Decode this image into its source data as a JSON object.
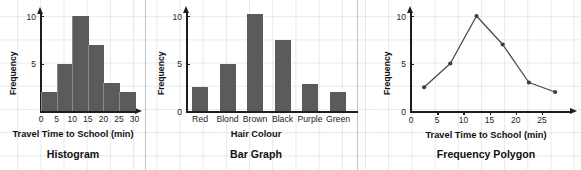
{
  "panels": [
    {
      "id": "histogram",
      "title": "Histogram",
      "xlabel": "Travel Time to School (min)",
      "ylabel": "Frequency",
      "xticks": [
        "0",
        "5",
        "10",
        "15",
        "20",
        "25",
        "30"
      ],
      "yticks": [
        "5",
        "10"
      ]
    },
    {
      "id": "bar-graph",
      "title": "Bar Graph",
      "xlabel": "Hair Colour",
      "ylabel": "Frequency",
      "yticks": [
        "0",
        "5",
        "10"
      ]
    },
    {
      "id": "frequency-polygon",
      "title": "Frequency Polygon",
      "xlabel": "Travel Time to School (min)",
      "ylabel": "Frequency",
      "xticks": [
        "0",
        "5",
        "10",
        "15",
        "20",
        "25"
      ],
      "yticks": [
        "0",
        "5",
        "10"
      ]
    }
  ],
  "colors": {
    "bar_fill": "#5b5b5b",
    "axis": "#1d1d1d",
    "grid": "#aab9cd",
    "separator": "#8c96a5",
    "text": "#111111"
  },
  "chart_data": [
    {
      "type": "bar",
      "title": "Histogram",
      "xlabel": "Travel Time to School (min)",
      "ylabel": "Frequency",
      "categories": [
        "0-5",
        "5-10",
        "10-15",
        "15-20",
        "20-25",
        "25-30"
      ],
      "bin_edges": [
        0,
        5,
        10,
        15,
        20,
        25,
        30
      ],
      "values": [
        2,
        5,
        10,
        7,
        3,
        2
      ],
      "xlim": [
        0,
        32
      ],
      "ylim": [
        0,
        11
      ],
      "xticks": [
        0,
        5,
        10,
        15,
        20,
        25,
        30
      ],
      "yticks": [
        5,
        10
      ],
      "grid": false,
      "legend": "none"
    },
    {
      "type": "bar",
      "title": "Bar Graph",
      "xlabel": "Hair Colour",
      "ylabel": "Frequency",
      "categories": [
        "Red",
        "Blond",
        "Brown",
        "Black",
        "Purple",
        "Green"
      ],
      "values": [
        2.5,
        5,
        10.2,
        7.5,
        2.8,
        2
      ],
      "ylim": [
        0,
        11
      ],
      "yticks": [
        0,
        5,
        10
      ],
      "grid": false,
      "legend": "none"
    },
    {
      "type": "line",
      "title": "Frequency Polygon",
      "xlabel": "Travel Time to School (min)",
      "ylabel": "Frequency",
      "x": [
        2.5,
        7.5,
        12.5,
        17.5,
        22.5,
        27.5
      ],
      "values": [
        2.5,
        5,
        10,
        7,
        3,
        2
      ],
      "xlim": [
        0,
        30
      ],
      "ylim": [
        0,
        11
      ],
      "xticks": [
        0,
        5,
        10,
        15,
        20,
        25
      ],
      "yticks": [
        0,
        5,
        10
      ],
      "markers": true,
      "grid": false,
      "legend": "none"
    }
  ]
}
